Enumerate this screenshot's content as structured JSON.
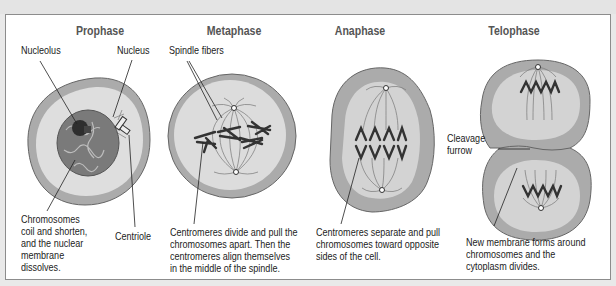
{
  "phases": [
    {
      "title": "Prophase",
      "labels": {
        "nucleolus": "Nucleolus",
        "nucleus": "Nucleus",
        "centriole": "Centriole"
      },
      "caption": [
        "Chromosomes",
        "coil and shorten,",
        "and the nuclear",
        "membrane",
        "dissolves."
      ]
    },
    {
      "title": "Metaphase",
      "labels": {
        "spindle_fibers": "Spindle fibers"
      },
      "caption": [
        "Centromeres divide and pull the",
        "chromosomes apart. Then the",
        "centromeres align themselves",
        "in the middle of the spindle."
      ]
    },
    {
      "title": "Anaphase",
      "labels": {},
      "caption": [
        "Centromeres separate and pull",
        "chromosomes toward opposite",
        "sides of the cell."
      ]
    },
    {
      "title": "Telophase",
      "labels": {
        "cleavage_furrow": [
          "Cleavage",
          "furrow"
        ]
      },
      "caption": [
        "New membrane forms around",
        "chromosomes and the",
        "cytoplasm divides."
      ]
    }
  ],
  "colors": {
    "cell_outer": "#a9a9a9",
    "cell_inner": "#d6d6d6",
    "nucleus": "#7d7d7d",
    "chromosome": "#3a3a3a",
    "text": "#222222",
    "title": "#555555"
  }
}
